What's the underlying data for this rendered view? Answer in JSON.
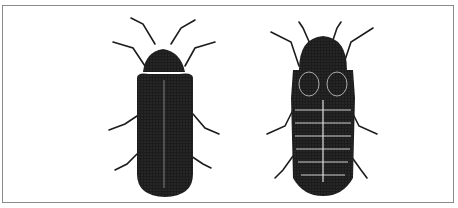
{
  "figure": {
    "description": "Line illustration of two beetles side by side within a rectangular frame",
    "subjects": [
      {
        "id": "left",
        "name": "winged beetle (dorsal view)",
        "features": "elongated body, striated elytra, head shield, 6 legs, 2 antennae"
      },
      {
        "id": "right",
        "name": "segmented larviform beetle (dorsal view)",
        "features": "rounded pronotum with two oval markings, segmented abdomen, 6 legs, 2 antennae"
      }
    ],
    "colors": {
      "ink": "#1a1a1a",
      "background": "#ffffff",
      "frame": "#8a8a8a"
    }
  }
}
